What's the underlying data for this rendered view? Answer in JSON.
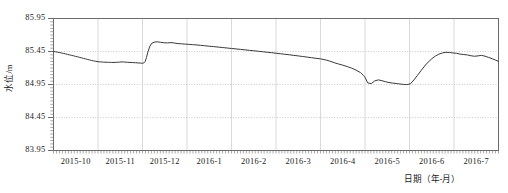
{
  "chart_data": {
    "type": "line",
    "title": "",
    "xlabel": "日期（年-月）",
    "ylabel": "水位/m",
    "grid": true,
    "legend_position": "none",
    "ylim": [
      83.95,
      85.95
    ],
    "ytick_labels": [
      "85.95",
      "85.45",
      "84.95",
      "84.45",
      "83.95"
    ],
    "ytick_values": [
      85.95,
      85.45,
      84.95,
      84.45,
      83.95
    ],
    "xtick_labels": [
      "2015-10",
      "2015-11",
      "2015-12",
      "2016-1",
      "2016-2",
      "2016-3",
      "2016-4",
      "2016-5",
      "2016-6",
      "2016-7"
    ],
    "x_axis_unit": "month",
    "series": [
      {
        "name": "水位",
        "color": "#3a3a3a",
        "x": [
          0.0,
          0.04,
          0.09,
          0.13,
          0.18,
          0.22,
          0.27,
          0.31,
          0.36,
          0.4,
          0.45,
          0.49,
          0.54,
          0.58,
          0.63,
          0.67,
          0.72,
          0.76,
          0.81,
          0.85,
          0.9,
          0.95,
          1.0,
          1.06,
          1.12,
          1.18,
          1.24,
          1.3,
          1.36,
          1.42,
          1.48,
          1.54,
          1.6,
          1.66,
          1.72,
          1.78,
          1.84,
          1.9,
          1.96,
          2.0,
          2.03,
          2.06,
          2.09,
          2.12,
          2.16,
          2.2,
          2.26,
          2.33,
          2.4,
          2.48,
          2.56,
          2.64,
          2.72,
          2.8,
          2.88,
          2.96,
          3.04,
          3.12,
          3.2,
          3.3,
          3.4,
          3.5,
          3.6,
          3.7,
          3.8,
          3.9,
          4.0,
          4.1,
          4.2,
          4.3,
          4.4,
          4.5,
          4.6,
          4.7,
          4.8,
          4.9,
          5.0,
          5.1,
          5.2,
          5.3,
          5.4,
          5.5,
          5.6,
          5.7,
          5.8,
          5.9,
          6.0,
          6.08,
          6.14,
          6.2,
          6.26,
          6.32,
          6.4,
          6.5,
          6.6,
          6.7,
          6.8,
          6.9,
          6.96,
          7.0,
          7.06,
          7.14,
          7.22,
          7.3,
          7.38,
          7.46,
          7.54,
          7.62,
          7.7,
          7.78,
          7.86,
          7.94,
          8.02,
          8.1,
          8.18,
          8.26,
          8.34,
          8.42,
          8.5,
          8.58,
          8.66,
          8.74,
          8.82,
          8.9,
          8.98,
          9.06,
          9.14,
          9.22,
          9.3,
          9.38,
          9.46,
          9.54,
          9.62,
          9.7,
          9.78,
          9.86,
          9.94,
          10.0
        ],
        "y": [
          85.45,
          85.446,
          85.44,
          85.434,
          85.428,
          85.421,
          85.414,
          85.407,
          85.399,
          85.392,
          85.385,
          85.377,
          85.37,
          85.362,
          85.354,
          85.346,
          85.338,
          85.33,
          85.322,
          85.315,
          85.308,
          85.301,
          85.295,
          85.292,
          85.289,
          85.287,
          85.286,
          85.285,
          85.284,
          85.286,
          85.289,
          85.293,
          85.29,
          85.287,
          85.284,
          85.282,
          85.28,
          85.277,
          85.274,
          85.272,
          85.276,
          85.3,
          85.36,
          85.44,
          85.52,
          85.57,
          85.592,
          85.597,
          85.59,
          85.583,
          85.58,
          85.585,
          85.578,
          85.57,
          85.566,
          85.562,
          85.558,
          85.554,
          85.55,
          85.544,
          85.537,
          85.53,
          85.524,
          85.517,
          85.51,
          85.503,
          85.496,
          85.489,
          85.482,
          85.475,
          85.468,
          85.461,
          85.454,
          85.446,
          85.439,
          85.432,
          85.424,
          85.416,
          85.408,
          85.4,
          85.391,
          85.383,
          85.374,
          85.365,
          85.356,
          85.347,
          85.338,
          85.328,
          85.318,
          85.306,
          85.293,
          85.278,
          85.262,
          85.243,
          85.222,
          85.198,
          85.168,
          85.13,
          85.09,
          85.06,
          84.975,
          84.963,
          85.005,
          85.02,
          85.008,
          84.992,
          84.98,
          84.972,
          84.965,
          84.958,
          84.952,
          84.948,
          84.96,
          85.02,
          85.09,
          85.16,
          85.23,
          85.29,
          85.34,
          85.38,
          85.41,
          85.428,
          85.438,
          85.434,
          85.428,
          85.422,
          85.41,
          85.404,
          85.398,
          85.386,
          85.378,
          85.384,
          85.392,
          85.378,
          85.36,
          85.34,
          85.318,
          85.3
        ]
      }
    ]
  }
}
